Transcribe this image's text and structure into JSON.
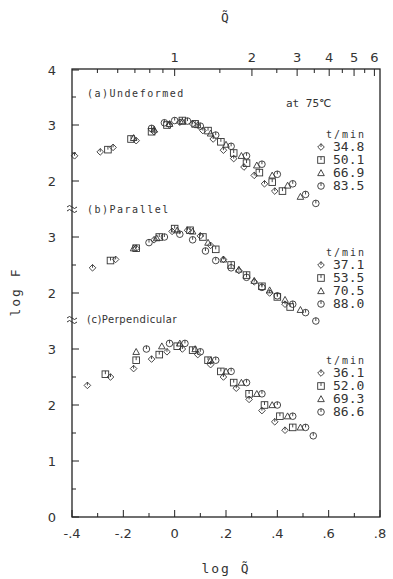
{
  "chart_data": {
    "type": "scatter",
    "title": "",
    "annotation": "at 75℃",
    "xlabel": "log Q̃",
    "top_xlabel": "Q̃",
    "ylabel": "log F",
    "xlim": [
      -0.4,
      0.8
    ],
    "x_ticks": [
      "-.4",
      "-.2",
      "0",
      ".2",
      ".4",
      ".6",
      ".8"
    ],
    "top_ticks": [
      "1",
      "2",
      "3",
      "4",
      "5",
      "6"
    ],
    "y_tick_labels_left": [
      "4",
      "3",
      "2",
      "3",
      "2",
      "3",
      "2",
      "1",
      "0"
    ],
    "grid": false,
    "legend_position": "right of each panel",
    "panels": [
      {
        "label": "(a)Undeformed",
        "legend_title": "t/min",
        "y_offset_units": 0,
        "series": [
          {
            "name": "34.8",
            "marker": "diamond",
            "points": [
              [
                -0.39,
                2.45
              ],
              [
                -0.29,
                2.52
              ],
              [
                -0.24,
                2.6
              ],
              [
                -0.15,
                2.72
              ],
              [
                -0.08,
                2.88
              ],
              [
                -0.02,
                3.0
              ],
              [
                0.02,
                3.05
              ],
              [
                0.07,
                3.02
              ],
              [
                0.11,
                2.9
              ],
              [
                0.15,
                2.75
              ],
              [
                0.19,
                2.55
              ],
              [
                0.23,
                2.4
              ],
              [
                0.27,
                2.25
              ],
              [
                0.31,
                2.1
              ],
              [
                0.35,
                1.95
              ],
              [
                0.39,
                1.82
              ]
            ]
          },
          {
            "name": "50.1",
            "marker": "square",
            "points": [
              [
                -0.26,
                2.56
              ],
              [
                -0.17,
                2.75
              ],
              [
                -0.09,
                2.88
              ],
              [
                -0.03,
                3.0
              ],
              [
                0.03,
                3.08
              ],
              [
                0.08,
                3.02
              ],
              [
                0.13,
                2.9
              ],
              [
                0.18,
                2.7
              ],
              [
                0.23,
                2.5
              ],
              [
                0.28,
                2.32
              ],
              [
                0.33,
                2.15
              ],
              [
                0.38,
                1.98
              ],
              [
                0.42,
                1.82
              ]
            ]
          },
          {
            "name": "66.9",
            "marker": "triangle",
            "points": [
              [
                -0.16,
                2.77
              ],
              [
                -0.08,
                2.92
              ],
              [
                -0.02,
                3.02
              ],
              [
                0.03,
                3.06
              ],
              [
                0.09,
                3.0
              ],
              [
                0.14,
                2.85
              ],
              [
                0.2,
                2.65
              ],
              [
                0.26,
                2.45
              ],
              [
                0.32,
                2.28
              ],
              [
                0.38,
                2.1
              ],
              [
                0.44,
                1.92
              ],
              [
                0.49,
                1.72
              ]
            ]
          },
          {
            "name": "83.5",
            "marker": "circle",
            "points": [
              [
                -0.09,
                2.94
              ],
              [
                -0.04,
                3.04
              ],
              [
                0.0,
                3.08
              ],
              [
                0.05,
                3.07
              ],
              [
                0.1,
                2.98
              ],
              [
                0.16,
                2.82
              ],
              [
                0.22,
                2.62
              ],
              [
                0.28,
                2.45
              ],
              [
                0.34,
                2.3
              ],
              [
                0.4,
                2.12
              ],
              [
                0.46,
                1.95
              ],
              [
                0.51,
                1.76
              ],
              [
                0.55,
                1.6
              ]
            ]
          }
        ]
      },
      {
        "label": "(b)Parallel",
        "legend_title": "t/min",
        "y_offset_units": -2.0,
        "series": [
          {
            "name": "37.1",
            "marker": "diamond",
            "points": [
              [
                -0.32,
                2.45
              ],
              [
                -0.23,
                2.6
              ],
              [
                -0.15,
                2.8
              ],
              [
                -0.08,
                2.95
              ],
              [
                -0.01,
                3.1
              ],
              [
                0.05,
                3.12
              ],
              [
                0.1,
                3.02
              ],
              [
                0.14,
                2.85
              ],
              [
                0.19,
                2.6
              ],
              [
                0.25,
                2.4
              ],
              [
                0.31,
                2.2
              ],
              [
                0.37,
                2.0
              ],
              [
                0.43,
                1.8
              ]
            ]
          },
          {
            "name": "53.5",
            "marker": "square",
            "points": [
              [
                -0.25,
                2.58
              ],
              [
                -0.15,
                2.8
              ],
              [
                -0.06,
                3.0
              ],
              [
                0.0,
                3.15
              ],
              [
                0.06,
                3.12
              ],
              [
                0.11,
                3.0
              ],
              [
                0.16,
                2.78
              ],
              [
                0.22,
                2.5
              ],
              [
                0.28,
                2.32
              ],
              [
                0.34,
                2.12
              ],
              [
                0.4,
                1.93
              ],
              [
                0.45,
                1.75
              ]
            ]
          },
          {
            "name": "70.5",
            "marker": "triangle",
            "points": [
              [
                -0.16,
                2.8
              ],
              [
                -0.07,
                2.98
              ],
              [
                0.01,
                3.12
              ],
              [
                0.07,
                3.1
              ],
              [
                0.13,
                2.9
              ],
              [
                0.19,
                2.6
              ],
              [
                0.25,
                2.42
              ],
              [
                0.31,
                2.22
              ],
              [
                0.37,
                2.05
              ],
              [
                0.43,
                1.88
              ],
              [
                0.49,
                1.7
              ]
            ]
          },
          {
            "name": "88.0",
            "marker": "circle",
            "points": [
              [
                -0.1,
                2.9
              ],
              [
                -0.04,
                3.0
              ],
              [
                0.02,
                3.05
              ],
              [
                0.07,
                2.95
              ],
              [
                0.12,
                2.75
              ],
              [
                0.16,
                2.58
              ],
              [
                0.22,
                2.45
              ],
              [
                0.28,
                2.28
              ],
              [
                0.34,
                2.1
              ],
              [
                0.4,
                1.95
              ],
              [
                0.46,
                1.8
              ],
              [
                0.51,
                1.65
              ],
              [
                0.55,
                1.5
              ]
            ]
          }
        ]
      },
      {
        "label": "(c)Perpendicular",
        "legend_title": "t/min",
        "y_offset_units": -4.0,
        "series": [
          {
            "name": "36.1",
            "marker": "diamond",
            "points": [
              [
                -0.34,
                2.35
              ],
              [
                -0.25,
                2.5
              ],
              [
                -0.16,
                2.65
              ],
              [
                -0.09,
                2.82
              ],
              [
                -0.03,
                2.95
              ],
              [
                0.03,
                3.0
              ],
              [
                0.09,
                2.9
              ],
              [
                0.14,
                2.72
              ],
              [
                0.19,
                2.5
              ],
              [
                0.24,
                2.3
              ],
              [
                0.29,
                2.1
              ],
              [
                0.34,
                1.9
              ],
              [
                0.39,
                1.7
              ],
              [
                0.43,
                1.55
              ]
            ]
          },
          {
            "name": "52.0",
            "marker": "square",
            "points": [
              [
                -0.27,
                2.55
              ],
              [
                -0.15,
                2.8
              ],
              [
                -0.06,
                2.9
              ],
              [
                0.01,
                3.05
              ],
              [
                0.07,
                2.98
              ],
              [
                0.13,
                2.8
              ],
              [
                0.18,
                2.6
              ],
              [
                0.23,
                2.4
              ],
              [
                0.29,
                2.2
              ],
              [
                0.35,
                2.0
              ],
              [
                0.41,
                1.8
              ],
              [
                0.46,
                1.6
              ]
            ]
          },
          {
            "name": "69.3",
            "marker": "triangle",
            "points": [
              [
                -0.15,
                2.95
              ],
              [
                -0.05,
                3.05
              ],
              [
                0.02,
                3.1
              ],
              [
                0.08,
                3.0
              ],
              [
                0.14,
                2.8
              ],
              [
                0.2,
                2.6
              ],
              [
                0.26,
                2.4
              ],
              [
                0.32,
                2.2
              ],
              [
                0.38,
                2.0
              ],
              [
                0.44,
                1.8
              ],
              [
                0.49,
                1.6
              ]
            ]
          },
          {
            "name": "86.6",
            "marker": "circle",
            "points": [
              [
                -0.11,
                3.0
              ],
              [
                -0.02,
                3.1
              ],
              [
                0.04,
                3.1
              ],
              [
                0.1,
                2.95
              ],
              [
                0.16,
                2.8
              ],
              [
                0.22,
                2.6
              ],
              [
                0.28,
                2.4
              ],
              [
                0.34,
                2.2
              ],
              [
                0.4,
                2.0
              ],
              [
                0.46,
                1.8
              ],
              [
                0.51,
                1.6
              ],
              [
                0.54,
                1.45
              ]
            ]
          }
        ]
      }
    ]
  },
  "labels": {
    "annotation": "at 75℃",
    "top_axis_title": "Q̃",
    "bottom_axis_title": "log Q̃",
    "y_axis_title": "log F",
    "panel_a": "(a)Undeformed",
    "panel_b": "(b)Parallel",
    "panel_c": "(c)Perpendicular",
    "legend_title": "t/min"
  }
}
